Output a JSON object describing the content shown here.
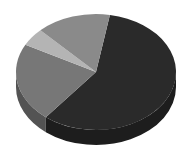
{
  "chart_data": {
    "type": "pie",
    "title": "",
    "categories": [
      "Slice A",
      "Slice B",
      "Slice C",
      "Slice D"
    ],
    "values": [
      58,
      22,
      5,
      15
    ],
    "colors": [
      "#2a2a2a",
      "#777777",
      "#b4b4b4",
      "#8a8a8a"
    ],
    "style": "3d",
    "legend": "none"
  }
}
